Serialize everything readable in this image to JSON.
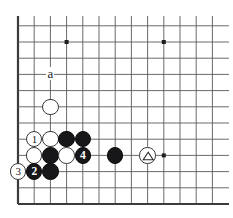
{
  "diagram": {
    "kind": "go-board-corner-diagram",
    "board_background": "#ffffff",
    "line_color": "#595959",
    "edge_color": "#3b3b3b",
    "black_color": "#17171a",
    "white_color": "#ffffff",
    "geometry": {
      "left_edge_x": 18,
      "top_y": 16,
      "bottom_edge_y": 204,
      "right_x": 229,
      "spacing": 16.2,
      "columns": 13,
      "rows": 12,
      "stone_radius": 8.2
    },
    "star_points": [
      {
        "col": 3,
        "row": 2
      },
      {
        "col": 9,
        "row": 2
      },
      {
        "col": 9,
        "row": 9
      }
    ],
    "stones": [
      {
        "col": 2,
        "row": 6,
        "color": "white",
        "label": "",
        "mark": ""
      },
      {
        "col": 1,
        "row": 8,
        "color": "white",
        "label": "1",
        "mark": ""
      },
      {
        "col": 2,
        "row": 8,
        "color": "white",
        "label": "",
        "mark": ""
      },
      {
        "col": 3,
        "row": 8,
        "color": "black",
        "label": "",
        "mark": ""
      },
      {
        "col": 4,
        "row": 8,
        "color": "black",
        "label": "",
        "mark": ""
      },
      {
        "col": 1,
        "row": 9,
        "color": "white",
        "label": "",
        "mark": ""
      },
      {
        "col": 2,
        "row": 9,
        "color": "black",
        "label": "",
        "mark": ""
      },
      {
        "col": 3,
        "row": 9,
        "color": "white",
        "label": "",
        "mark": ""
      },
      {
        "col": 4,
        "row": 9,
        "color": "black",
        "label": "4",
        "mark": ""
      },
      {
        "col": 6,
        "row": 9,
        "color": "black",
        "label": "",
        "mark": ""
      },
      {
        "col": 8,
        "row": 9,
        "color": "white",
        "label": "",
        "mark": "triangle"
      },
      {
        "col": 0,
        "row": 10,
        "color": "white",
        "label": "3",
        "mark": ""
      },
      {
        "col": 1,
        "row": 10,
        "color": "black",
        "label": "2",
        "mark": ""
      },
      {
        "col": 2,
        "row": 10,
        "color": "black",
        "label": "",
        "mark": ""
      }
    ],
    "point_markers": [
      {
        "col": 2,
        "row": 4,
        "text": "a"
      }
    ]
  }
}
